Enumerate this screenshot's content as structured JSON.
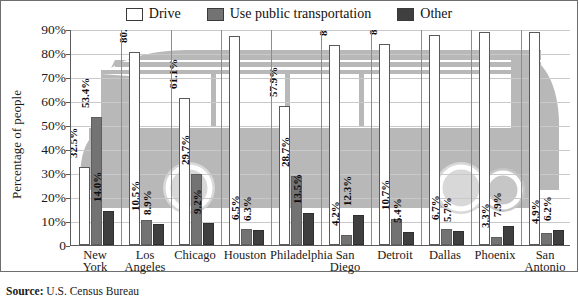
{
  "legend": {
    "entries": [
      {
        "label": "Drive",
        "color": "#ffffff",
        "icon": "legend-swatch-drive"
      },
      {
        "label": "Use public transportation",
        "color": "#737373",
        "icon": "legend-swatch-public"
      },
      {
        "label": "Other",
        "color": "#3f3f3f",
        "icon": "legend-swatch-other"
      }
    ]
  },
  "axes": {
    "ylabel": "Percentage of people",
    "yticks": [
      "0",
      "10%",
      "20%",
      "30%",
      "40%",
      "50%",
      "60%",
      "70%",
      "80%",
      "90%"
    ]
  },
  "source": {
    "label": "Source:",
    "text": "U.S. Census Bureau"
  },
  "background_art": {
    "name": "bus-watermark",
    "color": "#b8b8b8"
  },
  "chart_data": {
    "type": "bar",
    "title": "",
    "xlabel": "",
    "ylabel": "Percentage of people",
    "ylim": [
      0,
      90
    ],
    "ytick_step": 10,
    "grid": true,
    "legend_position": "top-center",
    "categories": [
      "New York",
      "Los Angeles",
      "Chicago",
      "Houston",
      "Philadelphia",
      "San Diego",
      "Detroit",
      "Dallas",
      "Phoenix",
      "San Antonio"
    ],
    "category_lines": [
      [
        "New",
        "York"
      ],
      [
        "Los",
        "Angeles"
      ],
      [
        "Chicago",
        ""
      ],
      [
        "Houston",
        ""
      ],
      [
        "Philadelphia",
        ""
      ],
      [
        "San",
        "Diego"
      ],
      [
        "Detroit",
        ""
      ],
      [
        "Dallas",
        ""
      ],
      [
        "Phoenix",
        ""
      ],
      [
        "San",
        "Antonio"
      ]
    ],
    "series": [
      {
        "name": "Drive",
        "color": "#ffffff",
        "values": [
          32.5,
          80.6,
          61.1,
          87.2,
          57.9,
          83.5,
          83.9,
          87.7,
          88.8,
          88.9
        ],
        "labels": [
          "32.5%",
          "80.6%",
          "61.1%",
          "87.2%",
          "57.9%",
          "83.5%",
          "83.9%",
          "87.7%",
          "88.8%",
          "88.9%"
        ]
      },
      {
        "name": "Use public transportation",
        "color": "#737373",
        "values": [
          53.4,
          10.5,
          29.7,
          6.5,
          28.7,
          4.2,
          10.7,
          6.7,
          3.3,
          4.9
        ],
        "labels": [
          "53.4%",
          "10.5%",
          "29.7%",
          "6.5%",
          "28.7%",
          "4.2%",
          "10.7%",
          "6.7%",
          "3.3%",
          "4.9%"
        ]
      },
      {
        "name": "Other",
        "color": "#3f3f3f",
        "values": [
          14.0,
          8.9,
          9.2,
          6.3,
          13.5,
          12.3,
          5.4,
          5.7,
          7.9,
          6.2
        ],
        "labels": [
          "14.0%",
          "8.9%",
          "9.2%",
          "6.3%",
          "13.5%",
          "12.3%",
          "5.4%",
          "5.7%",
          "7.9%",
          "6.2%"
        ]
      }
    ]
  }
}
